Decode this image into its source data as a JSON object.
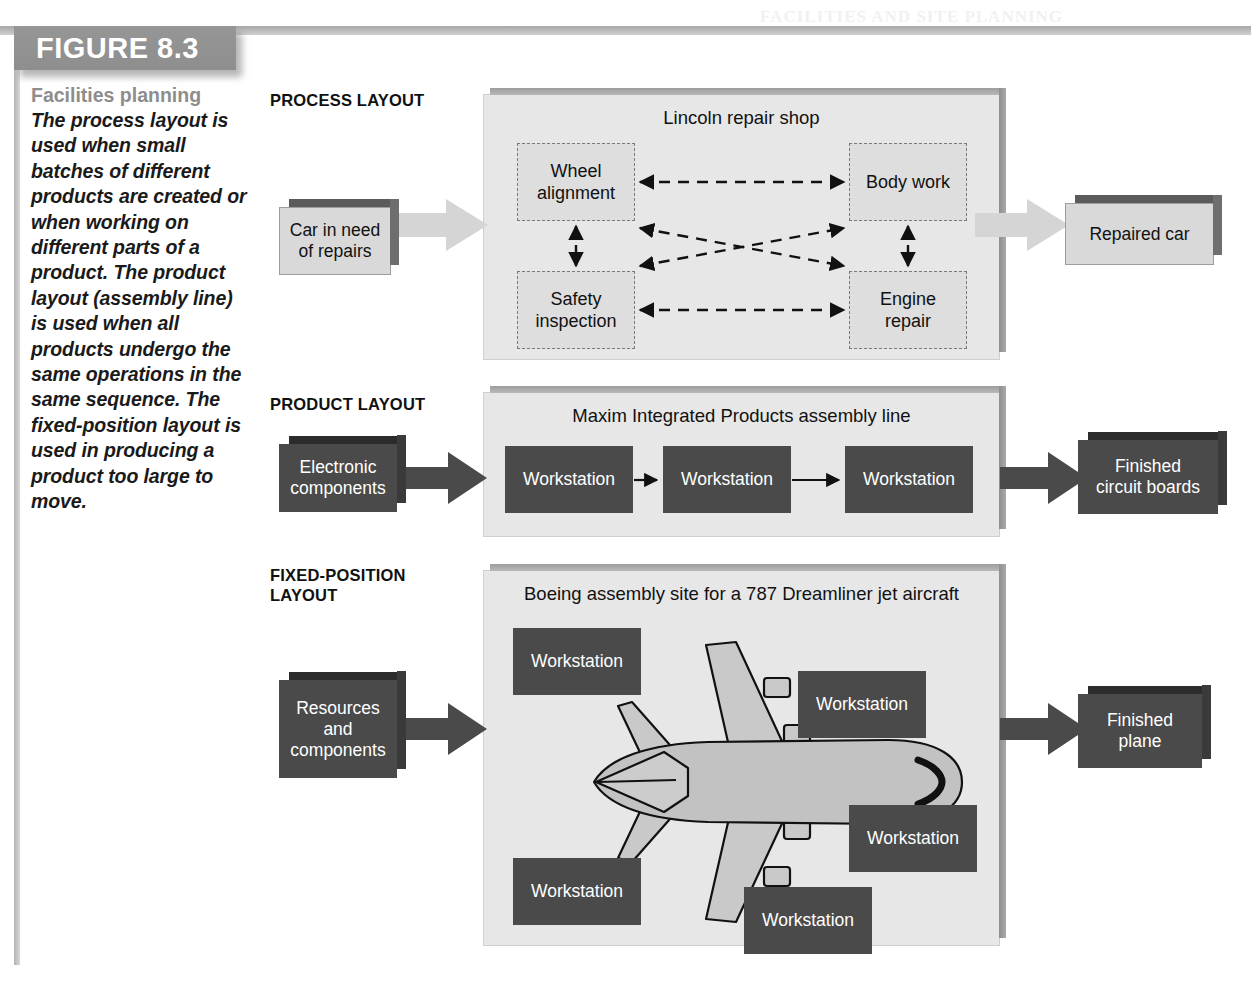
{
  "figure": {
    "tab_label": "FIGURE 8.3",
    "caption_title": "Facilities planning",
    "caption_body": "The process layout is used when small batches of different products are created or when working on different parts of a product. The product layout (assembly line) is used when all products undergo the same operations in the same sequence. The fixed-position layout is used in producing a product too large to move.",
    "credit": ""
  },
  "process_layout": {
    "section_label": "PROCESS LAYOUT",
    "input_block": "Car in need\nof repairs",
    "panel_title": "Lincoln repair shop",
    "boxes": [
      {
        "id": "wheel-alignment",
        "label": "Wheel\nalignment"
      },
      {
        "id": "body-work",
        "label": "Body work"
      },
      {
        "id": "safety-inspection",
        "label": "Safety\ninspection"
      },
      {
        "id": "engine-repair",
        "label": "Engine\nrepair"
      }
    ],
    "output_block": "Repaired car",
    "arrow_style": "dashed-double-headed"
  },
  "product_layout": {
    "section_label": "PRODUCT LAYOUT",
    "input_block": "Electronic\ncomponents",
    "panel_title": "Maxim Integrated Products assembly line",
    "stations": [
      "Workstation",
      "Workstation",
      "Workstation"
    ],
    "output_block": "Finished\ncircuit boards",
    "arrow_style": "solid-single-headed"
  },
  "fixed_position_layout": {
    "section_label": "FIXED-POSITION\nLAYOUT",
    "input_block": "Resources\nand\ncomponents",
    "panel_title": "Boeing assembly site for a 787 Dreamliner jet aircraft",
    "stations": [
      "Workstation",
      "Workstation",
      "Workstation",
      "Workstation",
      "Workstation"
    ],
    "illustration": "airplane-top-view",
    "output_block": "Finished\nplane"
  },
  "colors": {
    "tab_gray": "#8e8e8e",
    "caption_title_gray": "#8d8d8d",
    "panel_bg": "#e7e7e7",
    "dark_box": "#4a4a4a",
    "light_box": "#d9d9d9",
    "plane_fill": "#c4c4c4",
    "light_arrow": "#d5d5d5",
    "dark_arrow": "#4a4a4a"
  },
  "bleed_text": {
    "top": "FACILITIES AND SITE PLANNING",
    "lines": [
      "a maintenance history as long as",
      "the process on the next car in",
      "exercise to determine the best",
      "arrangements for the process",
      "that is repeated for each item"
    ]
  }
}
